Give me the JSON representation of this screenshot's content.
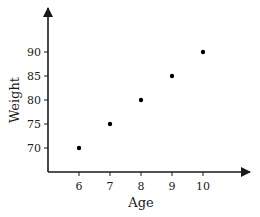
{
  "chart_data": {
    "type": "scatter",
    "title": "",
    "xlabel": "Age",
    "ylabel": "Weight",
    "x": [
      6,
      7,
      8,
      9,
      10
    ],
    "y": [
      70,
      75,
      80,
      85,
      90
    ],
    "series": [
      {
        "name": "Weight vs Age",
        "points": [
          [
            6,
            70
          ],
          [
            7,
            75
          ],
          [
            8,
            80
          ],
          [
            9,
            85
          ],
          [
            10,
            90
          ]
        ]
      }
    ],
    "xticks": [
      6,
      7,
      8,
      9,
      10
    ],
    "yticks": [
      70,
      75,
      80,
      85,
      90
    ],
    "xlim": [
      5,
      11.5
    ],
    "ylim": [
      65,
      94
    ],
    "grid": false,
    "legend": null,
    "axes_style": "arrowed axes from origin, no grid, black markers"
  },
  "colors": {
    "axis": "#1a1a1a",
    "marker": "#000000",
    "background": "#ffffff"
  }
}
